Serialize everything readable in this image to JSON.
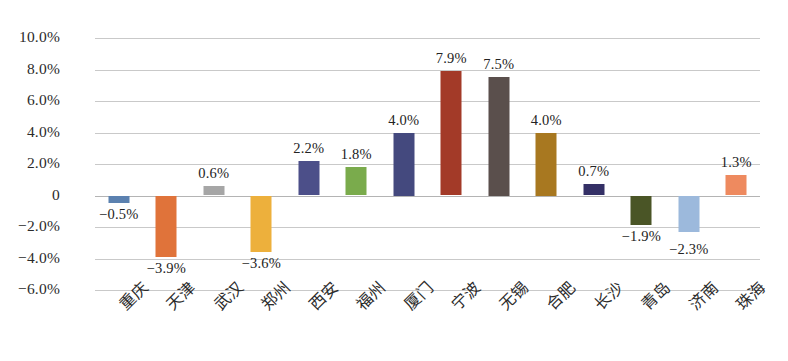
{
  "chart_data": {
    "type": "bar",
    "title": "",
    "subtitle": "",
    "xlabel": "",
    "ylabel": "",
    "ylim": [
      -6.0,
      10.0
    ],
    "ytick_values": [
      10.0,
      8.0,
      6.0,
      4.0,
      2.0,
      0,
      -2.0,
      -4.0,
      -6.0
    ],
    "ytick_labels": [
      "10.0%",
      "8.0%",
      "6.0%",
      "4.0%",
      "2.0%",
      "0",
      "−2.0%",
      "−4.0%",
      "−6.0%"
    ],
    "grid": true,
    "legend": "none",
    "value_labels_shown": true,
    "categories": [
      "重庆",
      "天津",
      "武汉",
      "郑州",
      "西安",
      "福州",
      "厦门",
      "宁波",
      "无锡",
      "合肥",
      "长沙",
      "青岛",
      "济南",
      "珠海"
    ],
    "values": [
      -0.5,
      -3.9,
      0.6,
      -3.6,
      2.2,
      1.8,
      4.0,
      7.9,
      7.5,
      4.0,
      0.7,
      -1.9,
      -2.3,
      1.3
    ],
    "value_labels": [
      "−0.5%",
      "−3.9%",
      "0.6%",
      "−3.6%",
      "2.2%",
      "1.8%",
      "4.0%",
      "7.9%",
      "7.5%",
      "4.0%",
      "0.7%",
      "−1.9%",
      "−2.3%",
      "1.3%"
    ],
    "colors": [
      "#5b81b0",
      "#e0733a",
      "#a6a6a6",
      "#edb03c",
      "#4c4f89",
      "#7aab4c",
      "#44497e",
      "#a33a28",
      "#5a4f4c",
      "#a87820",
      "#343066",
      "#4a5526",
      "#9cb9dc",
      "#ee8a5f"
    ]
  }
}
